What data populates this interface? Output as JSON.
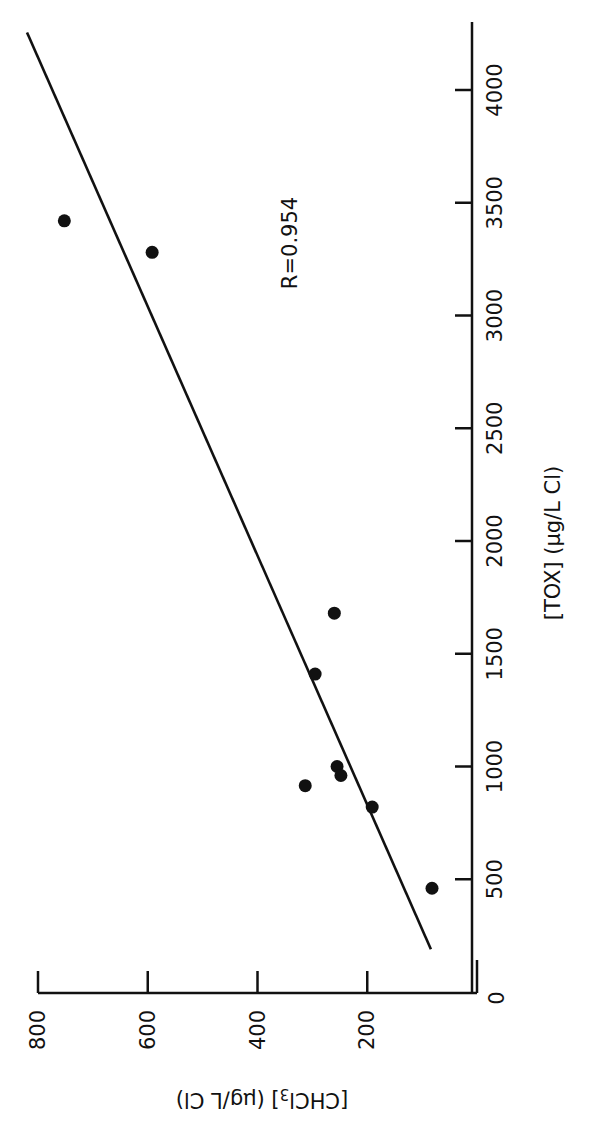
{
  "chart_data": {
    "type": "scatter",
    "orientation": "rotated -90deg (x-axis runs vertically on right, y-axis runs horizontally at bottom)",
    "title": "",
    "xlabel": "[TOX] (µg/L Cl)",
    "ylabel": "[CHCl3] (µg/L Cl)",
    "xlim": [
      0,
      4000
    ],
    "ylim": [
      0,
      800
    ],
    "x_ticks": [
      500,
      1000,
      1500,
      2000,
      2500,
      3000,
      3500,
      4000
    ],
    "x_tick_labels": [
      "500",
      "1000",
      "1500",
      "2000",
      "2500",
      "3000",
      "3500",
      "4000"
    ],
    "y_ticks": [
      200,
      400,
      600,
      800
    ],
    "y_tick_labels": [
      "200",
      "400",
      "600",
      "800"
    ],
    "origin_label": "0",
    "grid": false,
    "legend": null,
    "annotations": [
      {
        "text": "R=0.954"
      }
    ],
    "series": [
      {
        "name": "data points",
        "marker": "filled-circle",
        "points": [
          {
            "x": 3420,
            "y": 752
          },
          {
            "x": 3280,
            "y": 592
          },
          {
            "x": 1680,
            "y": 260
          },
          {
            "x": 1410,
            "y": 295
          },
          {
            "x": 915,
            "y": 313
          },
          {
            "x": 1000,
            "y": 255
          },
          {
            "x": 960,
            "y": 248
          },
          {
            "x": 820,
            "y": 191
          },
          {
            "x": 460,
            "y": 82
          }
        ]
      },
      {
        "name": "regression line",
        "kind": "line",
        "points": [
          {
            "x": 190,
            "y": 84
          },
          {
            "x": 4255,
            "y": 820
          }
        ]
      }
    ]
  },
  "labels": {
    "x_axis_title": "[TOX] (µg/L Cl)",
    "y_axis_title_main": "[CHCl",
    "y_axis_title_sub": "3",
    "y_axis_title_tail": "] (µg/L Cl)",
    "annotation": "R=0.954",
    "origin": "0"
  },
  "colors": {
    "ink": "#111111",
    "background": "#ffffff"
  }
}
